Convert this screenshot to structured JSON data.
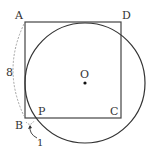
{
  "diagram": {
    "type": "geometry",
    "points": {
      "A": {
        "label": "A",
        "x": 25,
        "y": 22
      },
      "B": {
        "label": "B",
        "x": 25,
        "y": 118
      },
      "C": {
        "label": "C",
        "x": 121,
        "y": 118
      },
      "D": {
        "label": "D",
        "x": 121,
        "y": 22
      },
      "O": {
        "label": "O",
        "x": 85,
        "y": 83
      },
      "P": {
        "label": "P",
        "x": 33,
        "y": 118
      }
    },
    "circle": {
      "cx": 85,
      "cy": 83,
      "r": 60
    },
    "measurements": {
      "AB": {
        "label": "8"
      },
      "BP": {
        "label": "1"
      }
    },
    "colors": {
      "stroke": "#333333",
      "dashed": "#999999"
    }
  }
}
